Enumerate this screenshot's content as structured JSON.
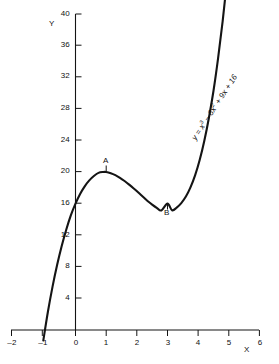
{
  "chart_data": {
    "type": "line",
    "title": "",
    "equation_label": "y = x³ − 6x² + 9x + 16",
    "equation_parts": {
      "lead": "y = x",
      "exp1": "3",
      "mid1": " − 6x",
      "exp2": "2",
      "tail": " + 9x + 16"
    },
    "xlabel": "X",
    "ylabel": "Y",
    "xlim": [
      -2,
      6
    ],
    "ylim": [
      0,
      40
    ],
    "xticks": [
      -2,
      -1,
      0,
      1,
      2,
      3,
      4,
      5,
      6
    ],
    "xtick_labels": [
      "–2",
      "–1",
      "0",
      "1",
      "2",
      "3",
      "4",
      "5",
      "6"
    ],
    "yticks": [
      4,
      8,
      12,
      16,
      20,
      24,
      28,
      32,
      36,
      40
    ],
    "ytick_labels": [
      "4",
      "8",
      "12",
      "16",
      "20",
      "24",
      "28",
      "32",
      "36",
      "40"
    ],
    "grid": false,
    "legend": "none",
    "curve_domain": [
      -1.05,
      5.45
    ],
    "series": [
      {
        "name": "y = x³ − 6x² + 9x + 16",
        "x": [
          -1.05,
          -0.9,
          -0.75,
          -0.6,
          -0.45,
          -0.3,
          -0.15,
          0,
          0.15,
          0.3,
          0.45,
          0.6,
          0.75,
          0.9,
          1.0,
          1.15,
          1.3,
          1.45,
          1.6,
          1.75,
          1.9,
          2.05,
          2.2,
          2.35,
          2.5,
          2.65,
          2.8,
          3.0,
          3.15,
          3.3,
          3.45,
          3.6,
          3.75,
          3.9,
          4.05,
          4.2,
          4.35,
          4.5,
          4.65,
          4.8,
          4.95,
          5.1,
          5.25,
          5.45
        ],
        "y": [
          -1.32,
          2.31,
          5.46,
          8.22,
          10.63,
          12.73,
          14.54,
          16.0,
          17.22,
          18.19,
          18.94,
          19.5,
          19.89,
          20.0,
          20.0,
          19.85,
          19.6,
          19.26,
          18.86,
          18.41,
          17.92,
          17.4,
          16.86,
          16.33,
          15.88,
          15.47,
          15.13,
          16.0,
          15.16,
          15.49,
          16.06,
          16.89,
          18.05,
          19.57,
          21.52,
          23.93,
          26.84,
          30.25,
          34.37,
          39.11,
          44.51,
          50.88,
          57.89,
          68.45
        ],
        "color": "#141414"
      }
    ],
    "annotations": [
      {
        "label": "A",
        "x": 1,
        "y": 20,
        "note": "local-maximum",
        "position": "above"
      },
      {
        "label": "B",
        "x": 3,
        "y": 16,
        "note": "local-minimum",
        "position": "below"
      }
    ]
  }
}
